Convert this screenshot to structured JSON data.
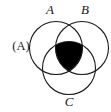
{
  "figure": {
    "label": "(A)",
    "type": "venn-diagram",
    "set_count": 3,
    "background_color": "#ffffff",
    "stroke_color": "#1a1a1a",
    "shade_color": "#000000"
  },
  "sets": [
    {
      "id": "A",
      "label": "A",
      "cx": 56,
      "cy": 48,
      "r": 26.5,
      "label_x": 50,
      "label_y": 10
    },
    {
      "id": "B",
      "label": "B",
      "cx": 82,
      "cy": 48,
      "r": 26.5,
      "label_x": 85,
      "label_y": 10
    },
    {
      "id": "C",
      "label": "C",
      "cx": 69,
      "cy": 68,
      "r": 26.5,
      "label_x": 69,
      "label_y": 104
    }
  ],
  "shaded_regions": [
    {
      "name": "A-intersect-B-intersect-C",
      "description": "central triple intersection filled solid black",
      "fill": "#000000"
    }
  ]
}
